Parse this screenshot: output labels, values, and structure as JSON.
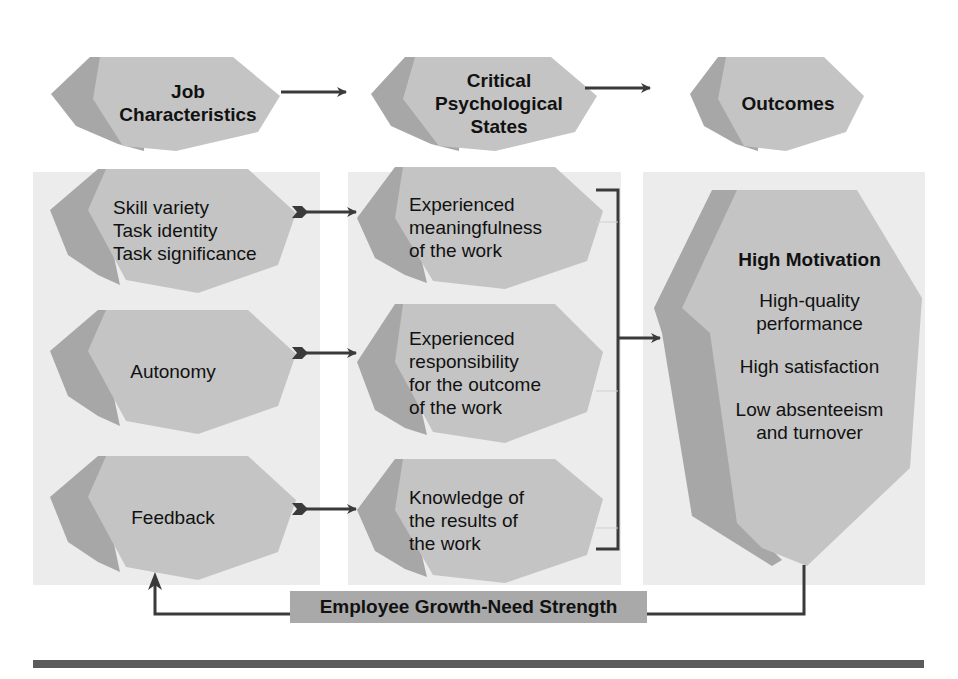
{
  "colors": {
    "panel": "#ececec",
    "shape_face": "#c4c4c4",
    "shape_side": "#a7a7a7",
    "arrow": "#3a3a3a",
    "growth_bar": "#a9a9a9",
    "bottom_rule": "#5b5b5b"
  },
  "headers": {
    "job_characteristics": [
      "Job",
      "Characteristics"
    ],
    "critical_states": [
      "Critical",
      "Psychological",
      "States"
    ],
    "outcomes": [
      "Outcomes"
    ]
  },
  "job_characteristics": [
    {
      "lines": [
        "Skill variety",
        "Task identity",
        "Task significance"
      ]
    },
    {
      "lines": [
        "Autonomy"
      ]
    },
    {
      "lines": [
        "Feedback"
      ]
    }
  ],
  "critical_states": [
    {
      "lines": [
        "Experienced",
        "meaningfulness",
        "of the work"
      ]
    },
    {
      "lines": [
        "Experienced",
        "responsibility",
        "for the outcome",
        "of the work"
      ]
    },
    {
      "lines": [
        "Knowledge of",
        "the results of",
        "the work"
      ]
    }
  ],
  "outcomes": {
    "title": "High Motivation",
    "items": [
      [
        "High-quality",
        "performance"
      ],
      [
        "High satisfaction"
      ],
      [
        "Low absenteeism",
        "and turnover"
      ]
    ]
  },
  "moderator": {
    "label": "Employee Growth-Need Strength"
  }
}
